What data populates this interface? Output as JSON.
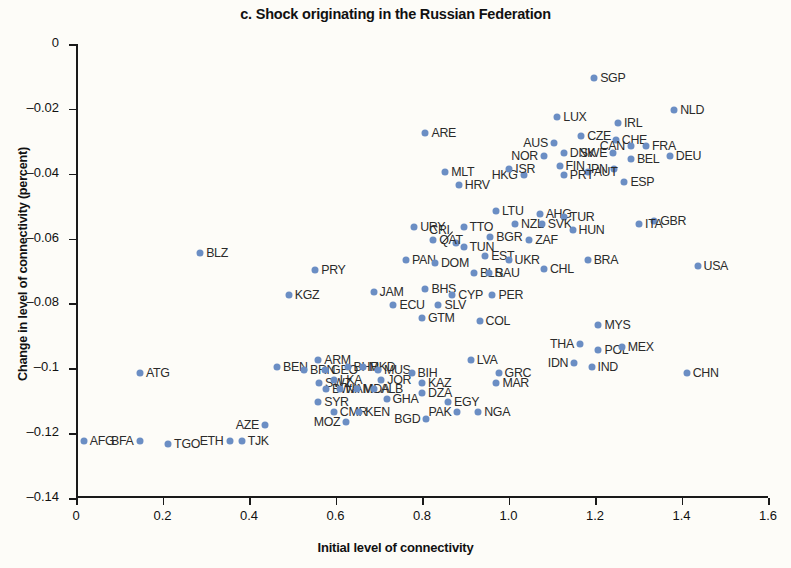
{
  "chart_data": {
    "type": "scatter",
    "title": "c. Shock originating in the Russian Federation",
    "xlabel": "Initial level of connectivity",
    "ylabel": "Change in level of connectivity (percent)",
    "xlim": [
      0,
      1.6
    ],
    "ylim": [
      -0.14,
      0
    ],
    "xticks": [
      "0",
      "0.2",
      "0.4",
      "0.6",
      "0.8",
      "1.0",
      "1.2",
      "1.4",
      "1.6"
    ],
    "xtick_values": [
      0,
      0.2,
      0.4,
      0.6,
      0.8,
      1.0,
      1.2,
      1.4,
      1.6
    ],
    "yticks": [
      "0",
      "–0.02",
      "–0.04",
      "–0.06",
      "–0.08",
      "–0.1",
      "–0.12",
      "–0.14"
    ],
    "ytick_values": [
      0,
      -0.02,
      -0.04,
      -0.06,
      -0.08,
      -0.1,
      -0.12,
      -0.14
    ],
    "grid": false,
    "legend": null,
    "marker_color": "#6b8ec4",
    "points": [
      {
        "label": "SGP",
        "x": 1.198,
        "y": -0.0105,
        "lp": "right"
      },
      {
        "label": "NLD",
        "x": 1.383,
        "y": -0.0205,
        "lp": "right"
      },
      {
        "label": "LUX",
        "x": 1.113,
        "y": -0.0225,
        "lp": "right"
      },
      {
        "label": "IRL",
        "x": 1.253,
        "y": -0.0245,
        "lp": "right"
      },
      {
        "label": "CHE",
        "x": 1.248,
        "y": -0.0295,
        "lp": "right"
      },
      {
        "label": "CZE",
        "x": 1.168,
        "y": -0.0285,
        "lp": "right"
      },
      {
        "label": "AUS",
        "x": 1.105,
        "y": -0.0305,
        "lp": "left"
      },
      {
        "label": "CAN",
        "x": 1.283,
        "y": -0.0315,
        "lp": "left"
      },
      {
        "label": "FRA",
        "x": 1.318,
        "y": -0.0315,
        "lp": "right"
      },
      {
        "label": "SWE",
        "x": 1.242,
        "y": -0.0335,
        "lp": "left"
      },
      {
        "label": "DNK",
        "x": 1.128,
        "y": -0.0335,
        "lp": "right"
      },
      {
        "label": "NOR",
        "x": 1.082,
        "y": -0.0345,
        "lp": "left"
      },
      {
        "label": "ARE",
        "x": 0.808,
        "y": -0.0275,
        "lp": "right"
      },
      {
        "label": "DEU",
        "x": 1.373,
        "y": -0.0345,
        "lp": "right"
      },
      {
        "label": "BEL",
        "x": 1.283,
        "y": -0.0355,
        "lp": "right"
      },
      {
        "label": "FIN",
        "x": 1.118,
        "y": -0.0375,
        "lp": "right"
      },
      {
        "label": "JPN",
        "x": 1.243,
        "y": -0.0385,
        "lp": "left"
      },
      {
        "label": "AUT",
        "x": 1.183,
        "y": -0.0395,
        "lp": "right"
      },
      {
        "label": "PRT",
        "x": 1.128,
        "y": -0.0405,
        "lp": "right"
      },
      {
        "label": "HKG",
        "x": 1.035,
        "y": -0.0405,
        "lp": "left"
      },
      {
        "label": "ISR",
        "x": 1.002,
        "y": -0.0385,
        "lp": "right"
      },
      {
        "label": "MLT",
        "x": 0.854,
        "y": -0.0395,
        "lp": "right"
      },
      {
        "label": "ESP",
        "x": 1.268,
        "y": -0.0425,
        "lp": "right"
      },
      {
        "label": "HRV",
        "x": 0.885,
        "y": -0.0435,
        "lp": "right"
      },
      {
        "label": "GBR",
        "x": 1.337,
        "y": -0.0545,
        "lp": "right"
      },
      {
        "label": "ITA",
        "x": 1.302,
        "y": -0.0555,
        "lp": "right"
      },
      {
        "label": "LTU",
        "x": 0.971,
        "y": -0.0515,
        "lp": "right"
      },
      {
        "label": "AHG",
        "x": 1.072,
        "y": -0.0525,
        "lp": "right"
      },
      {
        "label": "TUR",
        "x": 1.128,
        "y": -0.0535,
        "lp": "right"
      },
      {
        "label": "NZL",
        "x": 1.015,
        "y": -0.0555,
        "lp": "right"
      },
      {
        "label": "SVK",
        "x": 1.077,
        "y": -0.0555,
        "lp": "right"
      },
      {
        "label": "URY",
        "x": 0.782,
        "y": -0.0565,
        "lp": "right"
      },
      {
        "label": "TTO",
        "x": 0.896,
        "y": -0.0565,
        "lp": "right"
      },
      {
        "label": "CRI",
        "x": 0.878,
        "y": -0.0615,
        "lp": "leader"
      },
      {
        "label": "HUN",
        "x": 1.148,
        "y": -0.0575,
        "lp": "right"
      },
      {
        "label": "BGR",
        "x": 0.958,
        "y": -0.0595,
        "lp": "right"
      },
      {
        "label": "ZAF",
        "x": 1.048,
        "y": -0.0605,
        "lp": "right"
      },
      {
        "label": "QAT",
        "x": 0.826,
        "y": -0.0605,
        "lp": "right"
      },
      {
        "label": "TUN",
        "x": 0.896,
        "y": -0.0625,
        "lp": "right"
      },
      {
        "label": "BLZ",
        "x": 0.287,
        "y": -0.0643,
        "lp": "right"
      },
      {
        "label": "EST",
        "x": 0.946,
        "y": -0.0655,
        "lp": "right"
      },
      {
        "label": "UKR",
        "x": 1.0,
        "y": -0.0665,
        "lp": "right"
      },
      {
        "label": "PAN",
        "x": 0.763,
        "y": -0.0665,
        "lp": "right"
      },
      {
        "label": "DOM",
        "x": 0.83,
        "y": -0.0675,
        "lp": "right"
      },
      {
        "label": "USA",
        "x": 1.437,
        "y": -0.0685,
        "lp": "right"
      },
      {
        "label": "BRA",
        "x": 1.183,
        "y": -0.0665,
        "lp": "right"
      },
      {
        "label": "PRY",
        "x": 0.553,
        "y": -0.0697,
        "lp": "right"
      },
      {
        "label": "CHL",
        "x": 1.082,
        "y": -0.0695,
        "lp": "right"
      },
      {
        "label": "BLR",
        "x": 0.92,
        "y": -0.0705,
        "lp": "right"
      },
      {
        "label": "SAU",
        "x": 0.955,
        "y": -0.0705,
        "lp": "right"
      },
      {
        "label": "KGZ",
        "x": 0.492,
        "y": -0.0775,
        "lp": "right"
      },
      {
        "label": "JAM",
        "x": 0.688,
        "y": -0.0765,
        "lp": "right"
      },
      {
        "label": "BHS",
        "x": 0.808,
        "y": -0.0755,
        "lp": "right"
      },
      {
        "label": "CYP",
        "x": 0.87,
        "y": -0.0775,
        "lp": "right"
      },
      {
        "label": "PER",
        "x": 0.963,
        "y": -0.0775,
        "lp": "right"
      },
      {
        "label": "ECU",
        "x": 0.734,
        "y": -0.0805,
        "lp": "right"
      },
      {
        "label": "SLV",
        "x": 0.838,
        "y": -0.0805,
        "lp": "right"
      },
      {
        "label": "GTM",
        "x": 0.8,
        "y": -0.0845,
        "lp": "right"
      },
      {
        "label": "COL",
        "x": 0.933,
        "y": -0.0855,
        "lp": "right"
      },
      {
        "label": "MYS",
        "x": 1.208,
        "y": -0.0865,
        "lp": "right"
      },
      {
        "label": "THA",
        "x": 1.165,
        "y": -0.0925,
        "lp": "left"
      },
      {
        "label": "POL",
        "x": 1.208,
        "y": -0.0945,
        "lp": "right"
      },
      {
        "label": "MEX",
        "x": 1.262,
        "y": -0.0935,
        "lp": "right"
      },
      {
        "label": "IDN",
        "x": 1.152,
        "y": -0.0985,
        "lp": "left"
      },
      {
        "label": "IND",
        "x": 1.192,
        "y": -0.0995,
        "lp": "right"
      },
      {
        "label": "CHN",
        "x": 1.412,
        "y": -0.1015,
        "lp": "right"
      },
      {
        "label": "ARM",
        "x": 0.56,
        "y": -0.0975,
        "lp": "right"
      },
      {
        "label": "LVA",
        "x": 0.913,
        "y": -0.0975,
        "lp": "right"
      },
      {
        "label": "BEN",
        "x": 0.465,
        "y": -0.0995,
        "lp": "right"
      },
      {
        "label": "BRN",
        "x": 0.527,
        "y": -0.1005,
        "lp": "right"
      },
      {
        "label": "ATG",
        "x": 0.148,
        "y": -0.1015,
        "lp": "right"
      },
      {
        "label": "GEO",
        "x": 0.576,
        "y": -0.1005,
        "lp": "right"
      },
      {
        "label": "BHR",
        "x": 0.628,
        "y": -0.0995,
        "lp": "right"
      },
      {
        "label": "MKD",
        "x": 0.663,
        "y": -0.0995,
        "lp": "right"
      },
      {
        "label": "MUS",
        "x": 0.698,
        "y": -0.1005,
        "lp": "right"
      },
      {
        "label": "BIH",
        "x": 0.776,
        "y": -0.1015,
        "lp": "right"
      },
      {
        "label": "GRC",
        "x": 0.977,
        "y": -0.1015,
        "lp": "right"
      },
      {
        "label": "SWZ",
        "x": 0.562,
        "y": -0.1045,
        "lp": "right"
      },
      {
        "label": "LKA",
        "x": 0.596,
        "y": -0.1035,
        "lp": "right"
      },
      {
        "label": "JOR",
        "x": 0.706,
        "y": -0.1035,
        "lp": "right"
      },
      {
        "label": "KAZ",
        "x": 0.8,
        "y": -0.1045,
        "lp": "right"
      },
      {
        "label": "MAR",
        "x": 0.972,
        "y": -0.1045,
        "lp": "right"
      },
      {
        "label": "BWA",
        "x": 0.578,
        "y": -0.1065,
        "lp": "right"
      },
      {
        "label": "NAM",
        "x": 0.61,
        "y": -0.1065,
        "lp": "right"
      },
      {
        "label": "MDA",
        "x": 0.65,
        "y": -0.1065,
        "lp": "right"
      },
      {
        "label": "ALB",
        "x": 0.69,
        "y": -0.1065,
        "lp": "right"
      },
      {
        "label": "DZA",
        "x": 0.8,
        "y": -0.1075,
        "lp": "right"
      },
      {
        "label": "SYR",
        "x": 0.56,
        "y": -0.1105,
        "lp": "right"
      },
      {
        "label": "GHA",
        "x": 0.718,
        "y": -0.1095,
        "lp": "right"
      },
      {
        "label": "EGY",
        "x": 0.86,
        "y": -0.1105,
        "lp": "right"
      },
      {
        "label": "CMR",
        "x": 0.596,
        "y": -0.1135,
        "lp": "right"
      },
      {
        "label": "KEN",
        "x": 0.655,
        "y": -0.1135,
        "lp": "right"
      },
      {
        "label": "PAK",
        "x": 0.882,
        "y": -0.1135,
        "lp": "left"
      },
      {
        "label": "NGA",
        "x": 0.93,
        "y": -0.1135,
        "lp": "right"
      },
      {
        "label": "BGD",
        "x": 0.81,
        "y": -0.1155,
        "lp": "left"
      },
      {
        "label": "MOZ",
        "x": 0.625,
        "y": -0.1165,
        "lp": "left"
      },
      {
        "label": "AZE",
        "x": 0.437,
        "y": -0.1175,
        "lp": "left"
      },
      {
        "label": "AFG",
        "x": 0.018,
        "y": -0.1225,
        "lp": "right"
      },
      {
        "label": "BFA",
        "x": 0.147,
        "y": -0.1225,
        "lp": "left"
      },
      {
        "label": "TGO",
        "x": 0.213,
        "y": -0.1235,
        "lp": "right"
      },
      {
        "label": "ETH",
        "x": 0.355,
        "y": -0.1225,
        "lp": "left"
      },
      {
        "label": "TJK",
        "x": 0.383,
        "y": -0.1225,
        "lp": "right"
      }
    ]
  }
}
